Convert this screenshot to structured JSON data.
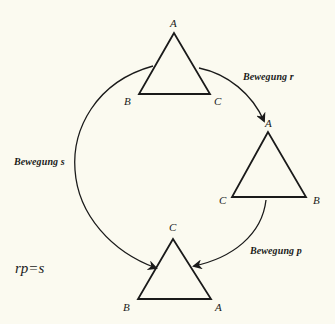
{
  "diagram": {
    "background": "#fbfaf0",
    "stroke_color": "#1a1a1a",
    "triangles": {
      "top": {
        "apex": "A",
        "bottom_left": "B",
        "bottom_right": "C"
      },
      "right": {
        "apex": "A",
        "bottom_left": "C",
        "bottom_right": "B"
      },
      "bottom": {
        "apex": "C",
        "bottom_left": "B",
        "bottom_right": "A"
      }
    },
    "motions": {
      "r": "Bewegung r",
      "s": "Bewegung s",
      "p": "Bewegung p"
    },
    "equation": "rp=s"
  }
}
